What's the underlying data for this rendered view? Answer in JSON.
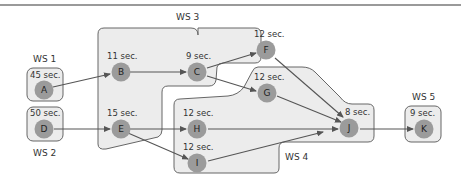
{
  "workstations": [
    {
      "id": "ws1",
      "label": "WS 1"
    },
    {
      "id": "ws2",
      "label": "WS 2"
    },
    {
      "id": "ws3",
      "label": "WS 3"
    },
    {
      "id": "ws4",
      "label": "WS 4"
    },
    {
      "id": "ws5",
      "label": "WS 5"
    }
  ],
  "nodes": {
    "A": {
      "label": "A",
      "time": "45 sec."
    },
    "B": {
      "label": "B",
      "time": "11 sec."
    },
    "C": {
      "label": "C",
      "time": "9 sec."
    },
    "D": {
      "label": "D",
      "time": "50 sec."
    },
    "E": {
      "label": "E",
      "time": "15 sec."
    },
    "F": {
      "label": "F",
      "time": "12 sec."
    },
    "G": {
      "label": "G",
      "time": "12 sec."
    },
    "H": {
      "label": "H",
      "time": "12 sec."
    },
    "I": {
      "label": "I",
      "time": "12 sec."
    },
    "J": {
      "label": "J",
      "time": "8 sec."
    },
    "K": {
      "label": "K",
      "time": "9 sec."
    }
  },
  "edges": [
    [
      "A",
      "B"
    ],
    [
      "B",
      "C"
    ],
    [
      "C",
      "F"
    ],
    [
      "C",
      "G"
    ],
    [
      "D",
      "E"
    ],
    [
      "E",
      "H"
    ],
    [
      "E",
      "I"
    ],
    [
      "F",
      "J"
    ],
    [
      "G",
      "J"
    ],
    [
      "H",
      "J"
    ],
    [
      "I",
      "J"
    ],
    [
      "J",
      "K"
    ]
  ],
  "colors": {
    "node_fill": "#9b9b9b",
    "zone_fill": "#ececec",
    "zone_stroke": "#666666",
    "edge": "#555555"
  }
}
